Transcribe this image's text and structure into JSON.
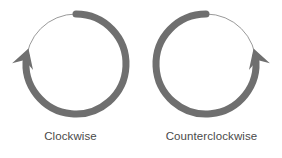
{
  "figure": {
    "background_color": "#ffffff",
    "stroke_color": "#6f6f6f",
    "hairline_color": "#9a9a9a",
    "text_color": "#4a4a4a",
    "width": 282,
    "height": 158
  },
  "panels": [
    {
      "id": "clockwise",
      "label": "Clockwise",
      "direction": "clockwise",
      "icon_name": "clockwise-rotation-arrow-icon",
      "center_x": 76,
      "center_y": 64,
      "radius": 50,
      "stroke_width": 7,
      "hairline_width": 1,
      "arrow_angle_deg": 188,
      "sweep_start_deg": 270,
      "sweep_end_deg": 188
    },
    {
      "id": "counterclockwise",
      "label": "Counterclockwise",
      "direction": "counterclockwise",
      "icon_name": "counterclockwise-rotation-arrow-icon",
      "center_x": 65,
      "center_y": 64,
      "radius": 50,
      "stroke_width": 7,
      "hairline_width": 1,
      "arrow_angle_deg": 352,
      "sweep_start_deg": 270,
      "sweep_end_deg": 352
    }
  ]
}
